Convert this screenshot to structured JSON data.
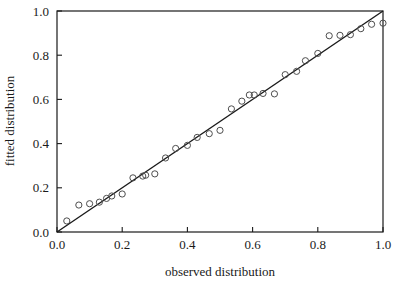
{
  "chart_data": {
    "type": "scatter",
    "title": "",
    "xlabel": "observed distribution",
    "ylabel": "fitted distribution",
    "xlim": [
      0.0,
      1.0
    ],
    "ylim": [
      0.0,
      1.0
    ],
    "xticks": [
      "0.0",
      "0.2",
      "0.4",
      "0.6",
      "0.8",
      "1.0"
    ],
    "yticks": [
      "0.0",
      "0.2",
      "0.4",
      "0.6",
      "0.8",
      "1.0"
    ],
    "xtick_values": [
      0.0,
      0.2,
      0.4,
      0.6,
      0.8,
      1.0
    ],
    "ytick_values": [
      0.0,
      0.2,
      0.4,
      0.6,
      0.8,
      1.0
    ],
    "grid": false,
    "legend": "none",
    "marker": "open-circle",
    "marker_color": "#4d4d4d",
    "line_color": "#1a1a1a",
    "reference_line": {
      "name": "identity-line",
      "x": [
        0.0,
        1.0
      ],
      "y": [
        0.0,
        1.0
      ]
    },
    "series": [
      {
        "name": "quantile-pairs",
        "points": [
          [
            0.03,
            0.05
          ],
          [
            0.067,
            0.122
          ],
          [
            0.1,
            0.128
          ],
          [
            0.13,
            0.135
          ],
          [
            0.152,
            0.152
          ],
          [
            0.168,
            0.163
          ],
          [
            0.2,
            0.172
          ],
          [
            0.233,
            0.245
          ],
          [
            0.263,
            0.253
          ],
          [
            0.272,
            0.257
          ],
          [
            0.3,
            0.263
          ],
          [
            0.333,
            0.335
          ],
          [
            0.364,
            0.378
          ],
          [
            0.4,
            0.392
          ],
          [
            0.43,
            0.428
          ],
          [
            0.467,
            0.445
          ],
          [
            0.5,
            0.46
          ],
          [
            0.535,
            0.557
          ],
          [
            0.567,
            0.592
          ],
          [
            0.59,
            0.62
          ],
          [
            0.605,
            0.62
          ],
          [
            0.632,
            0.627
          ],
          [
            0.667,
            0.625
          ],
          [
            0.7,
            0.712
          ],
          [
            0.735,
            0.727
          ],
          [
            0.762,
            0.775
          ],
          [
            0.8,
            0.808
          ],
          [
            0.835,
            0.888
          ],
          [
            0.868,
            0.89
          ],
          [
            0.9,
            0.893
          ],
          [
            0.932,
            0.92
          ],
          [
            0.965,
            0.94
          ],
          [
            1.0,
            0.945
          ]
        ]
      }
    ]
  }
}
